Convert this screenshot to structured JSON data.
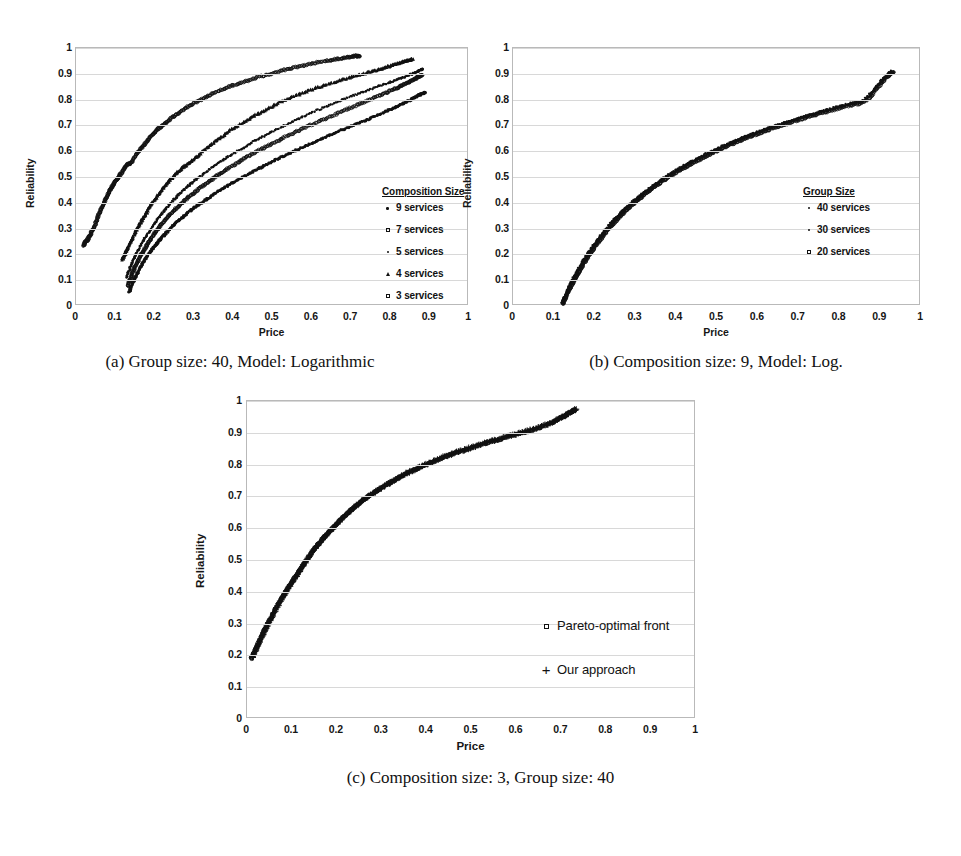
{
  "figure": {
    "y_axis_label": "Reliability",
    "x_axis_label": "Price",
    "y_ticks": [
      "0",
      "0.1",
      "0.2",
      "0.3",
      "0.4",
      "0.5",
      "0.6",
      "0.7",
      "0.8",
      "0.9",
      "1"
    ],
    "x_ticks": [
      "0",
      "0.1",
      "0.2",
      "0.3",
      "0.4",
      "0.5",
      "0.6",
      "0.7",
      "0.8",
      "0.9",
      "1"
    ]
  },
  "panels": {
    "a": {
      "caption": "(a) Group size: 40, Model: Logarithmic",
      "legend_title": "Composition Size",
      "legend_items": [
        {
          "label": "9 services",
          "marker": "dot"
        },
        {
          "label": "7 services",
          "marker": "ring"
        },
        {
          "label": "5 services",
          "marker": "sdot"
        },
        {
          "label": "4 services",
          "marker": "tri"
        },
        {
          "label": "3 services",
          "marker": "ring"
        }
      ]
    },
    "b": {
      "caption": "(b) Composition size: 9, Model: Log.",
      "legend_title": "Group Size",
      "legend_items": [
        {
          "label": "40 services",
          "marker": "sdot"
        },
        {
          "label": "30 services",
          "marker": "sdot"
        },
        {
          "label": "20 services",
          "marker": "ring"
        }
      ]
    },
    "c": {
      "caption": "(c) Composition size: 3, Group size: 40",
      "legend_items": [
        {
          "label": "Pareto-optimal front",
          "marker": "ring"
        },
        {
          "label": "Our approach",
          "marker": "plus"
        }
      ]
    }
  },
  "chart_data": [
    {
      "panel": "a",
      "type": "scatter",
      "title": "(a) Group size: 40, Model: Logarithmic",
      "xlabel": "Price",
      "ylabel": "Reliability",
      "xlim": [
        0,
        1
      ],
      "ylim": [
        0,
        1
      ],
      "grid": true,
      "legend_position": "inside-right",
      "legend_title": "Composition Size",
      "series": [
        {
          "name": "3 services",
          "marker": "ring",
          "x": [
            0.02,
            0.024,
            0.031,
            0.038,
            0.047,
            0.055,
            0.062,
            0.07,
            0.078,
            0.085,
            0.092,
            0.1,
            0.108,
            0.118,
            0.128,
            0.14,
            0.152,
            0.165,
            0.178,
            0.192,
            0.205,
            0.22,
            0.238,
            0.258,
            0.28,
            0.305,
            0.33,
            0.36,
            0.392,
            0.425,
            0.46,
            0.495,
            0.53,
            0.565,
            0.6,
            0.635,
            0.665,
            0.69,
            0.71,
            0.722
          ],
          "y": [
            0.235,
            0.248,
            0.26,
            0.282,
            0.31,
            0.34,
            0.37,
            0.398,
            0.422,
            0.445,
            0.465,
            0.483,
            0.5,
            0.522,
            0.545,
            0.555,
            0.585,
            0.61,
            0.635,
            0.66,
            0.682,
            0.7,
            0.722,
            0.745,
            0.768,
            0.79,
            0.81,
            0.832,
            0.852,
            0.868,
            0.885,
            0.9,
            0.915,
            0.928,
            0.94,
            0.95,
            0.958,
            0.964,
            0.968,
            0.97
          ]
        },
        {
          "name": "4 services",
          "marker": "tri",
          "x": [
            0.118,
            0.124,
            0.131,
            0.139,
            0.147,
            0.156,
            0.166,
            0.177,
            0.188,
            0.2,
            0.214,
            0.228,
            0.243,
            0.258,
            0.275,
            0.292,
            0.31,
            0.33,
            0.352,
            0.375,
            0.4,
            0.427,
            0.455,
            0.485,
            0.518,
            0.552,
            0.588,
            0.625,
            0.662,
            0.7,
            0.735,
            0.765,
            0.79,
            0.812,
            0.828,
            0.84,
            0.85,
            0.856
          ],
          "y": [
            0.18,
            0.2,
            0.222,
            0.248,
            0.272,
            0.3,
            0.328,
            0.355,
            0.385,
            0.412,
            0.44,
            0.468,
            0.495,
            0.518,
            0.54,
            0.56,
            0.582,
            0.608,
            0.635,
            0.66,
            0.688,
            0.712,
            0.738,
            0.762,
            0.788,
            0.81,
            0.832,
            0.852,
            0.87,
            0.888,
            0.902,
            0.915,
            0.926,
            0.936,
            0.944,
            0.95,
            0.954,
            0.956
          ]
        },
        {
          "name": "5 services",
          "marker": "sdot",
          "x": [
            0.128,
            0.134,
            0.141,
            0.149,
            0.158,
            0.168,
            0.179,
            0.191,
            0.204,
            0.218,
            0.233,
            0.249,
            0.266,
            0.284,
            0.303,
            0.324,
            0.346,
            0.37,
            0.396,
            0.424,
            0.452,
            0.482,
            0.514,
            0.548,
            0.582,
            0.618,
            0.655,
            0.692,
            0.728,
            0.762,
            0.792,
            0.818,
            0.838,
            0.855,
            0.868,
            0.876,
            0.882
          ],
          "y": [
            0.11,
            0.135,
            0.16,
            0.188,
            0.215,
            0.245,
            0.272,
            0.3,
            0.33,
            0.358,
            0.385,
            0.412,
            0.438,
            0.463,
            0.488,
            0.512,
            0.538,
            0.562,
            0.588,
            0.612,
            0.638,
            0.662,
            0.688,
            0.712,
            0.738,
            0.762,
            0.785,
            0.808,
            0.828,
            0.848,
            0.864,
            0.878,
            0.89,
            0.9,
            0.908,
            0.914,
            0.918
          ]
        },
        {
          "name": "7 services",
          "marker": "ring",
          "x": [
            0.132,
            0.138,
            0.145,
            0.153,
            0.162,
            0.172,
            0.183,
            0.195,
            0.208,
            0.222,
            0.238,
            0.255,
            0.273,
            0.292,
            0.312,
            0.334,
            0.357,
            0.382,
            0.408,
            0.436,
            0.466,
            0.497,
            0.53,
            0.564,
            0.6,
            0.636,
            0.672,
            0.708,
            0.742,
            0.775,
            0.803,
            0.826,
            0.845,
            0.86,
            0.872,
            0.88
          ],
          "y": [
            0.08,
            0.105,
            0.132,
            0.16,
            0.188,
            0.215,
            0.243,
            0.27,
            0.298,
            0.325,
            0.352,
            0.378,
            0.404,
            0.429,
            0.454,
            0.478,
            0.503,
            0.528,
            0.553,
            0.578,
            0.603,
            0.628,
            0.653,
            0.678,
            0.703,
            0.727,
            0.751,
            0.775,
            0.797,
            0.818,
            0.836,
            0.852,
            0.866,
            0.878,
            0.888,
            0.894
          ]
        },
        {
          "name": "9 services",
          "marker": "dot",
          "x": [
            0.136,
            0.142,
            0.15,
            0.159,
            0.169,
            0.18,
            0.192,
            0.205,
            0.22,
            0.236,
            0.253,
            0.272,
            0.292,
            0.313,
            0.336,
            0.36,
            0.386,
            0.413,
            0.442,
            0.472,
            0.503,
            0.536,
            0.57,
            0.605,
            0.64,
            0.676,
            0.712,
            0.746,
            0.778,
            0.806,
            0.83,
            0.85,
            0.866,
            0.878,
            0.888
          ],
          "y": [
            0.055,
            0.08,
            0.108,
            0.136,
            0.163,
            0.19,
            0.216,
            0.242,
            0.268,
            0.294,
            0.32,
            0.345,
            0.37,
            0.394,
            0.418,
            0.442,
            0.466,
            0.49,
            0.514,
            0.538,
            0.562,
            0.586,
            0.61,
            0.634,
            0.658,
            0.681,
            0.704,
            0.726,
            0.747,
            0.766,
            0.783,
            0.798,
            0.811,
            0.821,
            0.828
          ]
        }
      ]
    },
    {
      "panel": "b",
      "type": "scatter",
      "title": "(b) Composition size: 9, Model: Log.",
      "xlabel": "Price",
      "ylabel": "Reliability",
      "xlim": [
        0,
        1
      ],
      "ylim": [
        0,
        1
      ],
      "grid": true,
      "legend_position": "inside-right",
      "legend_title": "Group Size",
      "series": [
        {
          "name": "40 services",
          "marker": "sdot",
          "x": [
            0.12,
            0.128,
            0.138,
            0.149,
            0.161,
            0.174,
            0.188,
            0.203,
            0.219,
            0.236,
            0.254,
            0.273,
            0.293,
            0.314,
            0.336,
            0.359,
            0.383,
            0.408,
            0.434,
            0.461,
            0.489,
            0.518,
            0.548,
            0.579,
            0.611,
            0.644,
            0.678,
            0.713,
            0.749,
            0.786,
            0.824,
            0.86,
            0.89,
            0.912,
            0.928
          ],
          "y": [
            0.012,
            0.042,
            0.078,
            0.112,
            0.146,
            0.18,
            0.214,
            0.248,
            0.282,
            0.314,
            0.345,
            0.375,
            0.404,
            0.432,
            0.459,
            0.485,
            0.51,
            0.534,
            0.557,
            0.58,
            0.602,
            0.623,
            0.643,
            0.663,
            0.682,
            0.7,
            0.718,
            0.735,
            0.752,
            0.768,
            0.784,
            0.8,
            0.85,
            0.89,
            0.91
          ]
        },
        {
          "name": "30 services",
          "marker": "sdot",
          "x": [
            0.121,
            0.13,
            0.14,
            0.151,
            0.163,
            0.176,
            0.19,
            0.205,
            0.221,
            0.238,
            0.256,
            0.275,
            0.295,
            0.316,
            0.338,
            0.361,
            0.385,
            0.41,
            0.436,
            0.463,
            0.491,
            0.52,
            0.55,
            0.581,
            0.613,
            0.646,
            0.68,
            0.715,
            0.751,
            0.788,
            0.826,
            0.862,
            0.892,
            0.914,
            0.93
          ],
          "y": [
            0.01,
            0.04,
            0.075,
            0.109,
            0.143,
            0.177,
            0.211,
            0.245,
            0.279,
            0.311,
            0.342,
            0.372,
            0.401,
            0.429,
            0.456,
            0.482,
            0.507,
            0.531,
            0.554,
            0.577,
            0.599,
            0.62,
            0.64,
            0.66,
            0.679,
            0.697,
            0.715,
            0.732,
            0.749,
            0.765,
            0.781,
            0.797,
            0.848,
            0.888,
            0.908
          ]
        },
        {
          "name": "20 services",
          "marker": "ring",
          "x": [
            0.122,
            0.131,
            0.142,
            0.153,
            0.165,
            0.178,
            0.192,
            0.207,
            0.223,
            0.24,
            0.258,
            0.277,
            0.297,
            0.318,
            0.34,
            0.363,
            0.387,
            0.412,
            0.438,
            0.465,
            0.493,
            0.522,
            0.552,
            0.583,
            0.615,
            0.648,
            0.682,
            0.717,
            0.753,
            0.79,
            0.828,
            0.864,
            0.894,
            0.916,
            0.932
          ],
          "y": [
            0.008,
            0.038,
            0.072,
            0.106,
            0.14,
            0.174,
            0.208,
            0.242,
            0.276,
            0.308,
            0.339,
            0.369,
            0.398,
            0.426,
            0.453,
            0.479,
            0.504,
            0.528,
            0.551,
            0.574,
            0.596,
            0.617,
            0.637,
            0.657,
            0.676,
            0.694,
            0.712,
            0.729,
            0.746,
            0.762,
            0.778,
            0.794,
            0.846,
            0.886,
            0.906
          ]
        }
      ]
    },
    {
      "panel": "c",
      "type": "scatter",
      "title": "(c) Composition size: 3, Group size: 40",
      "xlabel": "Price",
      "ylabel": "Reliability",
      "xlim": [
        0,
        1
      ],
      "ylim": [
        0,
        1
      ],
      "grid": true,
      "legend_position": "inside-right",
      "series": [
        {
          "name": "Pareto-optimal front",
          "marker": "ring",
          "x": [
            0.01,
            0.018,
            0.028,
            0.038,
            0.05,
            0.062,
            0.075,
            0.088,
            0.102,
            0.116,
            0.13,
            0.145,
            0.16,
            0.176,
            0.192,
            0.21,
            0.228,
            0.248,
            0.268,
            0.29,
            0.312,
            0.336,
            0.36,
            0.386,
            0.412,
            0.44,
            0.468,
            0.498,
            0.528,
            0.558,
            0.588,
            0.618,
            0.648,
            0.676,
            0.7,
            0.718,
            0.73
          ],
          "y": [
            0.19,
            0.215,
            0.248,
            0.278,
            0.31,
            0.342,
            0.375,
            0.405,
            0.435,
            0.465,
            0.495,
            0.525,
            0.552,
            0.578,
            0.602,
            0.628,
            0.652,
            0.676,
            0.698,
            0.718,
            0.738,
            0.757,
            0.775,
            0.792,
            0.808,
            0.824,
            0.838,
            0.852,
            0.866,
            0.878,
            0.89,
            0.902,
            0.915,
            0.93,
            0.948,
            0.962,
            0.972
          ]
        },
        {
          "name": "Our approach",
          "marker": "plus",
          "x": [
            0.012,
            0.02,
            0.03,
            0.04,
            0.052,
            0.064,
            0.077,
            0.09,
            0.104,
            0.118,
            0.132,
            0.147,
            0.162,
            0.178,
            0.194,
            0.212,
            0.23,
            0.25,
            0.27,
            0.292,
            0.314,
            0.338,
            0.362,
            0.388,
            0.414,
            0.442,
            0.47,
            0.5,
            0.53,
            0.56,
            0.59,
            0.62,
            0.65,
            0.678,
            0.702,
            0.72,
            0.732
          ],
          "y": [
            0.192,
            0.218,
            0.25,
            0.28,
            0.312,
            0.344,
            0.377,
            0.407,
            0.437,
            0.467,
            0.497,
            0.527,
            0.554,
            0.58,
            0.604,
            0.63,
            0.654,
            0.678,
            0.7,
            0.72,
            0.74,
            0.759,
            0.777,
            0.794,
            0.81,
            0.826,
            0.84,
            0.854,
            0.868,
            0.88,
            0.892,
            0.904,
            0.917,
            0.932,
            0.95,
            0.964,
            0.974
          ]
        }
      ]
    }
  ]
}
